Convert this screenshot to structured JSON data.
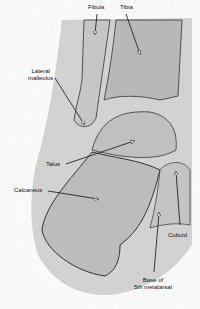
{
  "figure": {
    "type": "radiograph-diagram",
    "labels": [
      {
        "id": "fibula",
        "text": "Fibula"
      },
      {
        "id": "tibia",
        "text": "Tibia"
      },
      {
        "id": "lateral-malleolus",
        "text": "Lateral\nmalleolus",
        "line1": "Lateral",
        "line2": "malleolus"
      },
      {
        "id": "talus",
        "text": "Talus"
      },
      {
        "id": "calcaneus",
        "text": "Calcaneus"
      },
      {
        "id": "cuboid",
        "text": "Cuboid"
      },
      {
        "id": "base-5th-metatarsal",
        "text": "Base of\n5th metatarsal",
        "line1": "Base of",
        "line2": "5th metatarsal"
      }
    ],
    "colors": {
      "background": "#ffffff",
      "film": "#cfcfcf",
      "bone": "#bdbdbd",
      "outline": "#333333",
      "arrow": "#111111"
    }
  }
}
